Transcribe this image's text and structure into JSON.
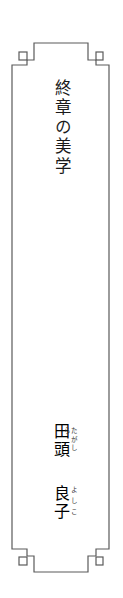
{
  "cover": {
    "title": "終章の美学",
    "author": {
      "family": "田頭",
      "family_ruby": "たがしら",
      "given": "良子",
      "given_ruby": "よしこ"
    },
    "frame_color": "#5a5a5a",
    "text_color": "#1a1a1a"
  }
}
